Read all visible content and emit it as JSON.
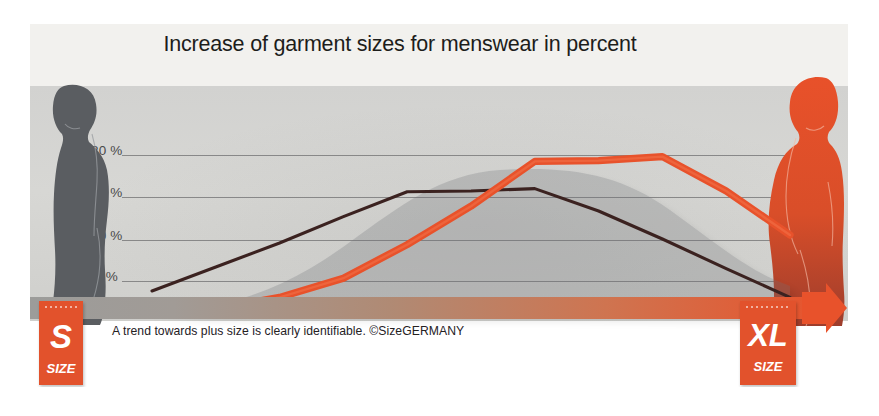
{
  "chart_data": {
    "type": "line",
    "title": "Increase of garment sizes for menswear in percent",
    "xlabel": "",
    "ylabel": "percent",
    "ylim": [
      0,
      22
    ],
    "yticks": [
      0,
      5,
      10,
      15,
      20
    ],
    "ytick_labels": [
      "0 %",
      "5 %",
      "10 %",
      "15 %",
      "20 %"
    ],
    "grid": true,
    "legend": "none",
    "x_axis_note": "Garment size axis from S (small) at left to XL (extra large) at right",
    "x": [
      0,
      1,
      2,
      3,
      4,
      5,
      6,
      7,
      8,
      9,
      10
    ],
    "series": [
      {
        "name": "Previous sizing distribution",
        "color": "#3b2220",
        "values": [
          3.0,
          6.0,
          9.0,
          12.3,
          15.4,
          15.5,
          15.8,
          13.0,
          9.5,
          5.8,
          2.2
        ]
      },
      {
        "name": "Current sizing distribution",
        "color": "#e8522b",
        "values": [
          0.2,
          0.8,
          2.2,
          4.6,
          8.8,
          13.6,
          19.2,
          19.3,
          19.8,
          15.5,
          10.0
        ]
      }
    ],
    "annotations": {
      "caption": "A trend towards plus size is clearly identifiable. ©SizeGERMANY",
      "copyright": "©SizeGERMANY"
    }
  },
  "header": {
    "title": "Increase of garment sizes for menswear in percent"
  },
  "axis": {
    "ticks": [
      {
        "label": "20 %",
        "value": 20
      },
      {
        "label": "15 %",
        "value": 15
      },
      {
        "label": "10 %",
        "value": 10
      },
      {
        "label": "5 %",
        "value": 5
      },
      {
        "label": "0 %",
        "value": 0
      }
    ]
  },
  "tags": {
    "left": {
      "size": "S",
      "sub": "SIZE"
    },
    "right": {
      "size": "XL",
      "sub": "SIZE"
    }
  },
  "footer": {
    "caption": "A trend towards plus size is clearly identifiable. ©SizeGERMANY"
  },
  "figures": {
    "left": {
      "name": "slim-male-silhouette",
      "color": "#575a5e"
    },
    "right": {
      "name": "heavy-male-silhouette",
      "color": "#e0532c"
    }
  },
  "colors": {
    "accent": "#e2522c",
    "dark_line": "#3b2220",
    "orange_line": "#e8522b",
    "panel": "#d4d4d1",
    "title_band": "#f2f1ee",
    "gridline": "#6f6f70"
  }
}
